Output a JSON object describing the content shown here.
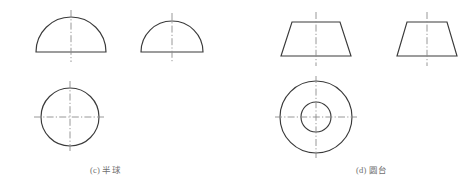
{
  "figure": {
    "background_color": "#ffffff",
    "outline_color": "#3a3a3a",
    "centerline_color": "#8d8d8d",
    "width": 476,
    "height": 192,
    "groups": [
      {
        "id": "c",
        "caption": "(c) 半球",
        "caption_label": "(c)",
        "caption_name": "半球",
        "views": [
          {
            "name": "front-view-semicircle",
            "type": "semicircle",
            "cx": 71,
            "cy": 52,
            "r": 35,
            "centerlines": [
              "vertical"
            ]
          },
          {
            "name": "side-view-semicircle",
            "type": "semicircle",
            "cx": 172,
            "cy": 52,
            "r": 31,
            "centerlines": [
              "vertical"
            ]
          },
          {
            "name": "top-view-circle",
            "type": "circle",
            "cx": 70,
            "cy": 117,
            "r": 29,
            "centerlines": [
              "vertical",
              "horizontal"
            ]
          }
        ]
      },
      {
        "id": "d",
        "caption": "(d) 圆台",
        "caption_label": "(d)",
        "caption_name": "圆台",
        "views": [
          {
            "name": "front-view-trapezoid",
            "type": "trapezoid",
            "cx": 316,
            "top_y": 22,
            "bottom_y": 56,
            "top_half_width": 24,
            "bottom_half_width": 35,
            "centerlines": [
              "vertical"
            ]
          },
          {
            "name": "side-view-trapezoid",
            "type": "trapezoid",
            "cx": 427,
            "top_y": 22,
            "bottom_y": 56,
            "top_half_width": 20,
            "bottom_half_width": 30,
            "centerlines": [
              "vertical"
            ]
          },
          {
            "name": "top-view-concentric-circles",
            "type": "concentric-circles",
            "cx": 316,
            "cy": 117,
            "r_outer": 36,
            "r_inner": 15,
            "centerlines": [
              "vertical",
              "horizontal"
            ]
          }
        ]
      }
    ]
  }
}
